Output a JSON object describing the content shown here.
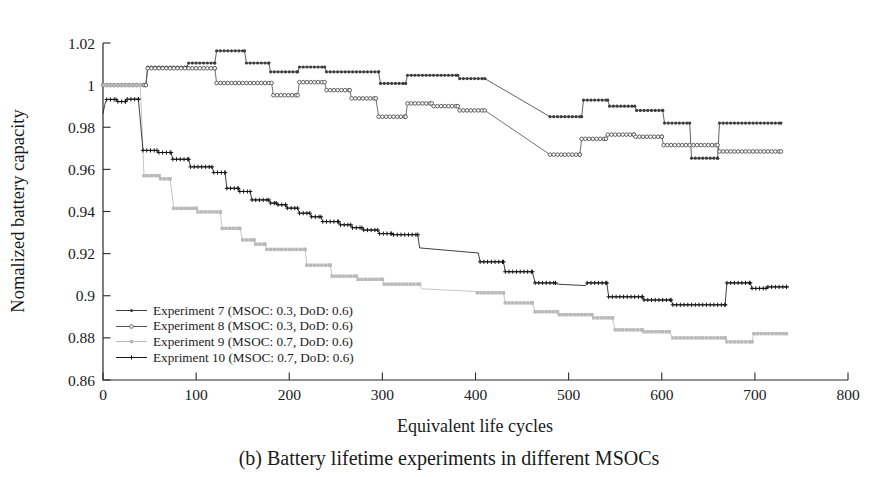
{
  "figure": {
    "caption": "(b) Battery lifetime experiments in different MSOCs",
    "background": "#ffffff"
  },
  "chart_data": {
    "type": "line",
    "title": "",
    "xlabel": "Equivalent life cycles",
    "ylabel": "Nomalized battery capacity",
    "xlim": [
      0,
      800
    ],
    "ylim": [
      0.86,
      1.02
    ],
    "xticks": [
      0,
      100,
      200,
      300,
      400,
      500,
      600,
      700,
      800
    ],
    "yticks": [
      {
        "v": 1.02,
        "label": "1.02"
      },
      {
        "v": 1.0,
        "label": "1"
      },
      {
        "v": 0.98,
        "label": "0.98"
      },
      {
        "v": 0.96,
        "label": "0.96"
      },
      {
        "v": 0.94,
        "label": "0.94"
      },
      {
        "v": 0.92,
        "label": "0.92"
      },
      {
        "v": 0.9,
        "label": "0.9"
      },
      {
        "v": 0.88,
        "label": "0.88"
      },
      {
        "v": 0.86,
        "label": "0.86"
      }
    ],
    "grid": false,
    "legend_position": "inside lower-left",
    "axis_color": "#2a2a2a",
    "series": [
      {
        "id": "experiment-7",
        "name": "Experiment 7 (MSOC: 0.3, DoD: 0.6)",
        "marker": "dot",
        "color": "#3d3d3d",
        "points": [
          [
            0,
            1.0
          ],
          [
            46,
            1.0
          ],
          [
            48,
            1.0085
          ],
          [
            90,
            1.0085
          ],
          [
            92,
            1.0105
          ],
          [
            120,
            1.0105
          ],
          [
            122,
            1.0163
          ],
          [
            152,
            1.0163
          ],
          [
            154,
            1.0105
          ],
          [
            178,
            1.0105
          ],
          [
            180,
            1.0063
          ],
          [
            209,
            1.0063
          ],
          [
            211,
            1.0086
          ],
          [
            238,
            1.0086
          ],
          [
            240,
            1.0063
          ],
          [
            296,
            1.0063
          ],
          [
            298,
            1.0008
          ],
          [
            325,
            1.0008
          ],
          [
            327,
            1.0047
          ],
          [
            381,
            1.0047
          ],
          [
            383,
            1.0031
          ],
          [
            410,
            1.0031
          ],
          [
            480,
            0.985
          ],
          [
            514,
            0.985
          ],
          [
            516,
            0.9929
          ],
          [
            542,
            0.9929
          ],
          [
            544,
            0.99
          ],
          [
            571,
            0.99
          ],
          [
            573,
            0.988
          ],
          [
            601,
            0.988
          ],
          [
            603,
            0.982
          ],
          [
            630,
            0.982
          ],
          [
            632,
            0.9653
          ],
          [
            660,
            0.9653
          ],
          [
            662,
            0.982
          ],
          [
            728,
            0.982
          ]
        ]
      },
      {
        "id": "experiment-8",
        "name": "Experiment 8 (MSOC: 0.3, DoD: 0.6)",
        "marker": "circle",
        "color": "#4f4f4f",
        "points": [
          [
            0,
            1.0
          ],
          [
            46,
            1.0
          ],
          [
            48,
            1.008
          ],
          [
            120,
            1.008
          ],
          [
            122,
            1.001
          ],
          [
            181,
            1.001
          ],
          [
            183,
            0.9952
          ],
          [
            209,
            0.9952
          ],
          [
            211,
            1.0014
          ],
          [
            238,
            1.0014
          ],
          [
            240,
            0.9976
          ],
          [
            265,
            0.9976
          ],
          [
            267,
            0.9937
          ],
          [
            293,
            0.9937
          ],
          [
            296,
            0.985
          ],
          [
            325,
            0.985
          ],
          [
            327,
            0.9913
          ],
          [
            353,
            0.9913
          ],
          [
            355,
            0.99
          ],
          [
            381,
            0.99
          ],
          [
            383,
            0.988
          ],
          [
            410,
            0.988
          ],
          [
            480,
            0.967
          ],
          [
            512,
            0.967
          ],
          [
            514,
            0.9745
          ],
          [
            540,
            0.9745
          ],
          [
            542,
            0.9765
          ],
          [
            570,
            0.9765
          ],
          [
            572,
            0.9755
          ],
          [
            600,
            0.9755
          ],
          [
            602,
            0.9715
          ],
          [
            660,
            0.9715
          ],
          [
            662,
            0.9685
          ],
          [
            728,
            0.9685
          ]
        ]
      },
      {
        "id": "experiment-9",
        "name": "Experiment 9 (MSOC: 0.7, DoD: 0.6)",
        "marker": "square",
        "color": "#b9b9b9",
        "points": [
          [
            0,
            1.0
          ],
          [
            40,
            1.0
          ],
          [
            44,
            0.957
          ],
          [
            60,
            0.957
          ],
          [
            62,
            0.9555
          ],
          [
            72,
            0.9555
          ],
          [
            76,
            0.9415
          ],
          [
            100,
            0.9415
          ],
          [
            102,
            0.9398
          ],
          [
            126,
            0.9398
          ],
          [
            128,
            0.932
          ],
          [
            147,
            0.932
          ],
          [
            150,
            0.9265
          ],
          [
            162,
            0.9265
          ],
          [
            164,
            0.9245
          ],
          [
            174,
            0.9245
          ],
          [
            176,
            0.922
          ],
          [
            217,
            0.922
          ],
          [
            219,
            0.9145
          ],
          [
            244,
            0.9145
          ],
          [
            246,
            0.9093
          ],
          [
            272,
            0.9093
          ],
          [
            274,
            0.9078
          ],
          [
            300,
            0.9078
          ],
          [
            302,
            0.9055
          ],
          [
            340,
            0.9055
          ],
          [
            342,
            0.9033
          ],
          [
            400,
            0.902
          ],
          [
            402,
            0.9014
          ],
          [
            430,
            0.9014
          ],
          [
            432,
            0.8966
          ],
          [
            461,
            0.8966
          ],
          [
            464,
            0.8924
          ],
          [
            488,
            0.8924
          ],
          [
            490,
            0.891
          ],
          [
            525,
            0.891
          ],
          [
            527,
            0.8895
          ],
          [
            547,
            0.8895
          ],
          [
            550,
            0.8838
          ],
          [
            579,
            0.8838
          ],
          [
            581,
            0.8829
          ],
          [
            608,
            0.8829
          ],
          [
            612,
            0.88
          ],
          [
            668,
            0.88
          ],
          [
            670,
            0.8781
          ],
          [
            697,
            0.8781
          ],
          [
            699,
            0.882
          ],
          [
            734,
            0.882
          ]
        ]
      },
      {
        "id": "expriment-10",
        "name": "Expriment 10 (MSOC: 0.7, DoD: 0.6)",
        "marker": "plus",
        "color": "#141414",
        "points": [
          [
            0,
            0.9865
          ],
          [
            2,
            0.991
          ],
          [
            4,
            0.9932
          ],
          [
            14,
            0.9932
          ],
          [
            16,
            0.9922
          ],
          [
            24,
            0.9922
          ],
          [
            26,
            0.9933
          ],
          [
            38,
            0.9933
          ],
          [
            43,
            0.969
          ],
          [
            58,
            0.969
          ],
          [
            60,
            0.968
          ],
          [
            73,
            0.968
          ],
          [
            75,
            0.9648
          ],
          [
            92,
            0.9648
          ],
          [
            94,
            0.9612
          ],
          [
            117,
            0.9612
          ],
          [
            119,
            0.9585
          ],
          [
            131,
            0.9585
          ],
          [
            133,
            0.951
          ],
          [
            145,
            0.951
          ],
          [
            147,
            0.9495
          ],
          [
            158,
            0.9495
          ],
          [
            160,
            0.9455
          ],
          [
            178,
            0.9455
          ],
          [
            180,
            0.944
          ],
          [
            186,
            0.944
          ],
          [
            188,
            0.9432
          ],
          [
            196,
            0.9432
          ],
          [
            198,
            0.9416
          ],
          [
            209,
            0.9416
          ],
          [
            211,
            0.9392
          ],
          [
            222,
            0.9392
          ],
          [
            224,
            0.9375
          ],
          [
            234,
            0.9375
          ],
          [
            236,
            0.9352
          ],
          [
            253,
            0.9352
          ],
          [
            255,
            0.9337
          ],
          [
            266,
            0.9337
          ],
          [
            268,
            0.9323
          ],
          [
            278,
            0.9323
          ],
          [
            280,
            0.9312
          ],
          [
            295,
            0.9312
          ],
          [
            297,
            0.9295
          ],
          [
            310,
            0.9295
          ],
          [
            312,
            0.929
          ],
          [
            338,
            0.929
          ],
          [
            340,
            0.9227
          ],
          [
            403,
            0.9203
          ],
          [
            405,
            0.9161
          ],
          [
            430,
            0.9161
          ],
          [
            432,
            0.9114
          ],
          [
            461,
            0.9114
          ],
          [
            464,
            0.9061
          ],
          [
            486,
            0.9061
          ],
          [
            488,
            0.9055
          ],
          [
            518,
            0.9048
          ],
          [
            520,
            0.9061
          ],
          [
            541,
            0.9061
          ],
          [
            543,
            0.8995
          ],
          [
            579,
            0.8995
          ],
          [
            581,
            0.898
          ],
          [
            610,
            0.898
          ],
          [
            612,
            0.8957
          ],
          [
            668,
            0.8957
          ],
          [
            670,
            0.9061
          ],
          [
            695,
            0.9061
          ],
          [
            697,
            0.9035
          ],
          [
            712,
            0.9035
          ],
          [
            714,
            0.9042
          ],
          [
            734,
            0.9042
          ]
        ]
      }
    ]
  }
}
